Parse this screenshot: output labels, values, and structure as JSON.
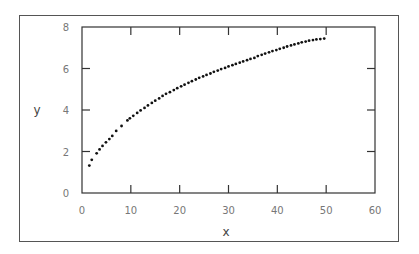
{
  "chart_data": {
    "type": "scatter",
    "title": "",
    "xlabel": "x",
    "ylabel": "y",
    "xlim": [
      0,
      60
    ],
    "ylim": [
      0,
      8
    ],
    "xticks": [
      0,
      10,
      20,
      30,
      40,
      50,
      60
    ],
    "yticks": [
      0,
      2,
      4,
      6,
      8
    ],
    "grid": false,
    "legend": null,
    "series": [
      {
        "name": "data",
        "x": [
          1.5,
          2.0,
          3.0,
          3.6,
          4.2,
          4.9,
          5.6,
          6.2,
          7.0,
          8.1,
          9.3,
          9.8,
          10.5,
          11.3,
          12.0,
          12.8,
          13.5,
          14.3,
          15.0,
          15.8,
          16.5,
          17.2,
          18.0,
          18.8,
          19.5,
          20.3,
          21.0,
          21.8,
          22.5,
          23.3,
          24.0,
          24.8,
          25.5,
          26.3,
          27.0,
          27.8,
          28.5,
          29.3,
          30.0,
          30.8,
          31.5,
          32.3,
          33.0,
          33.8,
          34.5,
          35.3,
          36.0,
          36.8,
          37.5,
          38.3,
          39.0,
          39.8,
          40.5,
          41.3,
          42.0,
          42.8,
          43.5,
          44.3,
          45.0,
          45.8,
          46.5,
          47.3,
          48.0,
          48.8,
          49.6
        ],
        "y": [
          1.32,
          1.6,
          1.91,
          2.1,
          2.27,
          2.44,
          2.6,
          2.75,
          2.99,
          3.23,
          3.5,
          3.6,
          3.72,
          3.86,
          3.98,
          4.1,
          4.22,
          4.34,
          4.45,
          4.56,
          4.68,
          4.78,
          4.86,
          4.96,
          5.05,
          5.14,
          5.22,
          5.31,
          5.39,
          5.47,
          5.55,
          5.62,
          5.69,
          5.76,
          5.84,
          5.9,
          5.97,
          6.03,
          6.1,
          6.16,
          6.22,
          6.28,
          6.34,
          6.4,
          6.46,
          6.51,
          6.6,
          6.66,
          6.72,
          6.78,
          6.84,
          6.89,
          6.95,
          7.0,
          7.06,
          7.11,
          7.16,
          7.21,
          7.26,
          7.3,
          7.34,
          7.37,
          7.4,
          7.42,
          7.44
        ]
      }
    ]
  }
}
